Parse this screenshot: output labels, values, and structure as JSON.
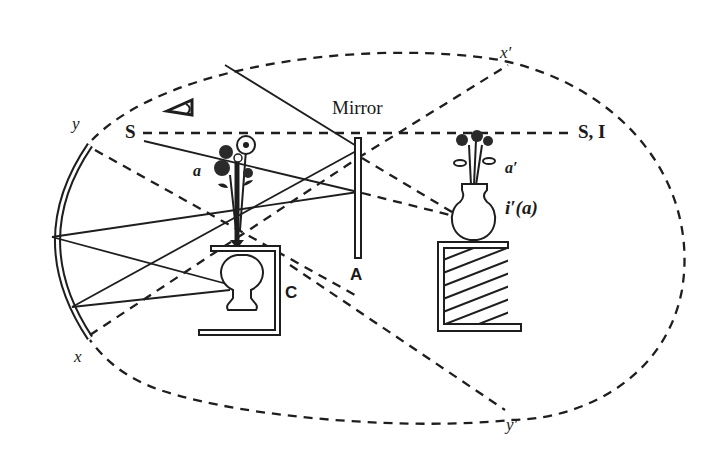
{
  "figure": {
    "labels": {
      "mirror": "Mirror",
      "mirror_point": "A",
      "box": "C",
      "source": "S",
      "source_image": "S, I",
      "object": "a",
      "object_image": "a′",
      "image_label": "i′(a)",
      "x": "x",
      "x_prime": "x′",
      "y": "y",
      "y_prime": "y′"
    },
    "icons": {
      "eye": "eye-icon",
      "flowers_real": "flower-bouquet-icon",
      "flowers_image": "flower-bouquet-image-icon",
      "vase_real": "vase-inverted-icon",
      "vase_image": "vase-icon"
    },
    "colors": {
      "ink": "#1e1e1e",
      "background": "#ffffff"
    }
  }
}
